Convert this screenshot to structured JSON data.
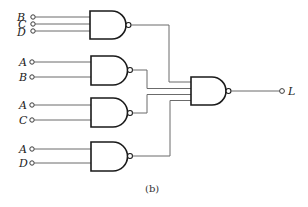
{
  "figure": {
    "caption": "(b)",
    "output_label": "L",
    "gate_type": "NAND",
    "colors": {
      "wire": "#6b6b6b",
      "gate": "#1a1a1a",
      "background": "#ffffff"
    }
  },
  "gates": [
    {
      "id": "G1",
      "type": "NAND",
      "inputs": [
        "B",
        "C",
        "D"
      ]
    },
    {
      "id": "G2",
      "type": "NAND",
      "inputs": [
        "A",
        "B"
      ]
    },
    {
      "id": "G3",
      "type": "NAND",
      "inputs": [
        "A",
        "C"
      ]
    },
    {
      "id": "G4",
      "type": "NAND",
      "inputs": [
        "A",
        "D"
      ]
    },
    {
      "id": "G5",
      "type": "NAND",
      "inputs": [
        "G1",
        "G2",
        "G3",
        "G4"
      ],
      "output": "L"
    }
  ],
  "input_labels": {
    "g1": [
      "B",
      "C",
      "D"
    ],
    "g2": [
      "A",
      "B"
    ],
    "g3": [
      "A",
      "C"
    ],
    "g4": [
      "A",
      "D"
    ]
  }
}
